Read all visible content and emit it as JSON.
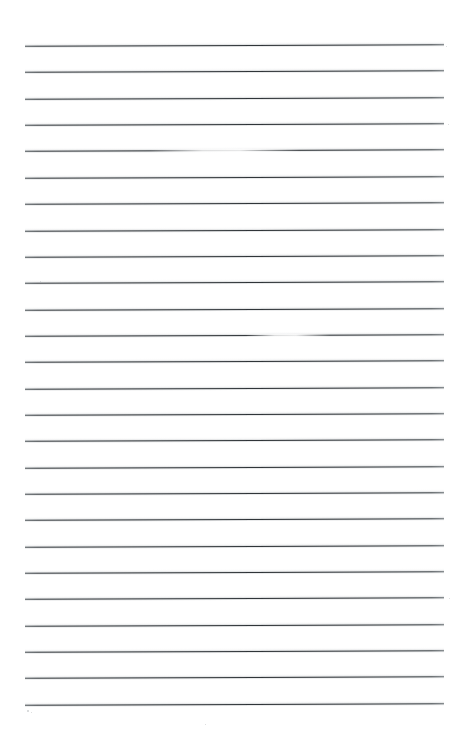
{
  "document": {
    "title": "Lined Notebook Page",
    "kind": "scanned-lined-paper",
    "page_width": 462,
    "page_height": 743,
    "background_color": "#ffffff",
    "rule_color": "#33383c",
    "halo_color": "#787e82",
    "rule_count": 26,
    "rule_left_x": 25,
    "rule_right_x": 444,
    "first_rule_y": 45,
    "rule_spacing": 26.35,
    "rule_thickness": 1.25,
    "scan_tilt_deg": -0.22,
    "text_content": "",
    "ruled_lines": [
      {
        "index": 1,
        "y": 45,
        "x1": 25,
        "x2": 444,
        "faded": false
      },
      {
        "index": 2,
        "y": 71.4,
        "x1": 25,
        "x2": 444,
        "faded": false
      },
      {
        "index": 3,
        "y": 97.7,
        "x1": 25,
        "x2": 444,
        "faded": false
      },
      {
        "index": 4,
        "y": 124.1,
        "x1": 25,
        "x2": 444,
        "faded": false
      },
      {
        "index": 5,
        "y": 150.4,
        "x1": 25,
        "x2": 444,
        "faded": true,
        "fade_x1": 150,
        "fade_x2": 300
      },
      {
        "index": 6,
        "y": 176.8,
        "x1": 25,
        "x2": 444,
        "faded": false
      },
      {
        "index": 7,
        "y": 203.1,
        "x1": 25,
        "x2": 444,
        "faded": false
      },
      {
        "index": 8,
        "y": 229.5,
        "x1": 25,
        "x2": 444,
        "faded": false
      },
      {
        "index": 9,
        "y": 255.8,
        "x1": 25,
        "x2": 444,
        "faded": false
      },
      {
        "index": 10,
        "y": 282.2,
        "x1": 25,
        "x2": 444,
        "faded": false
      },
      {
        "index": 11,
        "y": 308.5,
        "x1": 25,
        "x2": 444,
        "faded": false
      },
      {
        "index": 12,
        "y": 334.9,
        "x1": 25,
        "x2": 444,
        "faded": true,
        "fade_x1": 245,
        "fade_x2": 330
      },
      {
        "index": 13,
        "y": 361.2,
        "x1": 25,
        "x2": 444,
        "faded": false
      },
      {
        "index": 14,
        "y": 387.6,
        "x1": 25,
        "x2": 444,
        "faded": false
      },
      {
        "index": 15,
        "y": 413.9,
        "x1": 25,
        "x2": 444,
        "faded": false
      },
      {
        "index": 16,
        "y": 440.3,
        "x1": 25,
        "x2": 444,
        "faded": false
      },
      {
        "index": 17,
        "y": 466.6,
        "x1": 25,
        "x2": 444,
        "faded": false
      },
      {
        "index": 18,
        "y": 493.0,
        "x1": 25,
        "x2": 444,
        "faded": false
      },
      {
        "index": 19,
        "y": 519.3,
        "x1": 25,
        "x2": 444,
        "faded": false
      },
      {
        "index": 20,
        "y": 545.7,
        "x1": 25,
        "x2": 444,
        "faded": false
      },
      {
        "index": 21,
        "y": 572.0,
        "x1": 25,
        "x2": 444,
        "faded": false
      },
      {
        "index": 22,
        "y": 598.4,
        "x1": 25,
        "x2": 444,
        "faded": false
      },
      {
        "index": 23,
        "y": 624.7,
        "x1": 25,
        "x2": 444,
        "faded": false
      },
      {
        "index": 24,
        "y": 651.1,
        "x1": 25,
        "x2": 444,
        "faded": false
      },
      {
        "index": 25,
        "y": 677.4,
        "x1": 25,
        "x2": 444,
        "faded": false
      },
      {
        "index": 26,
        "y": 703.8,
        "x1": 25,
        "x2": 444,
        "faded": false
      }
    ],
    "specks": [
      {
        "x": 27,
        "y": 710,
        "size": 1.6
      },
      {
        "x": 31,
        "y": 712,
        "size": 1.2
      },
      {
        "x": 205,
        "y": 724,
        "size": 1.4
      },
      {
        "x": 446,
        "y": 46,
        "size": 1.3
      },
      {
        "x": 448,
        "y": 124,
        "size": 1.1
      },
      {
        "x": 40,
        "y": 281,
        "size": 1.2
      },
      {
        "x": 449,
        "y": 598,
        "size": 1.2
      }
    ],
    "margins": {
      "top": 45,
      "bottom": 39,
      "left": 25,
      "right": 18
    }
  }
}
